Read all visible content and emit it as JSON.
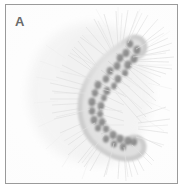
{
  "figure": {
    "panel_label": "A",
    "caption_text": "",
    "image_type": "photograph",
    "subject_description": "C-shaped curved caterpillar covered in long radiating setae, with paired dark dorsal tubercles along each body segment",
    "orientation": "curved, head toward upper right, posterior toward lower right",
    "colors": {
      "page_background": "#ffffff",
      "frame_border": "#9a9a9a",
      "photo_background": "#fdfdfd",
      "body_light": "#e2e2e2",
      "body_mid": "#cfcfcf",
      "tubercle_spot": "#8d8d8d",
      "tubercle_spot_dark": "#7a7a7a",
      "seta_hair": "#dcdcdc",
      "label_text": "#6b6b6b"
    },
    "body_segments": [
      {
        "index": 1,
        "x": 126,
        "y": 45,
        "angle": 215,
        "spots": 4
      },
      {
        "index": 2,
        "x": 119,
        "y": 53,
        "angle": 212,
        "spots": 4
      },
      {
        "index": 3,
        "x": 111,
        "y": 60,
        "angle": 208,
        "spots": 4
      },
      {
        "index": 4,
        "x": 103,
        "y": 67,
        "angle": 203,
        "spots": 4
      },
      {
        "index": 5,
        "x": 95,
        "y": 75,
        "angle": 196,
        "spots": 4
      },
      {
        "index": 6,
        "x": 89,
        "y": 84,
        "angle": 186,
        "spots": 4
      },
      {
        "index": 7,
        "x": 85,
        "y": 94,
        "angle": 172,
        "spots": 4
      },
      {
        "index": 8,
        "x": 84,
        "y": 105,
        "angle": 158,
        "spots": 4
      },
      {
        "index": 9,
        "x": 87,
        "y": 116,
        "angle": 144,
        "spots": 4
      },
      {
        "index": 10,
        "x": 94,
        "y": 126,
        "angle": 130,
        "spots": 4
      },
      {
        "index": 11,
        "x": 104,
        "y": 134,
        "angle": 120,
        "spots": 4
      },
      {
        "index": 12,
        "x": 115,
        "y": 140,
        "angle": 112,
        "spots": 4
      }
    ]
  }
}
